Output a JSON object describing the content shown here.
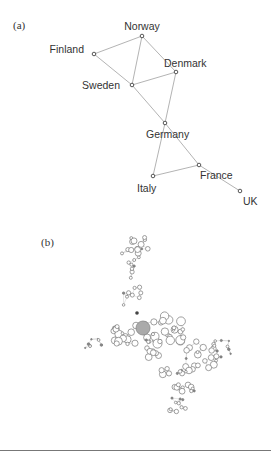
{
  "figure": {
    "panel_a": {
      "label": "(a)",
      "nodes": [
        {
          "id": "Norway",
          "label": "Norway",
          "x": 142,
          "y": 36,
          "lx": 142,
          "ly": 30,
          "anchor": "middle"
        },
        {
          "id": "Finland",
          "label": "Finland",
          "x": 94,
          "y": 54,
          "lx": 84,
          "ly": 53,
          "anchor": "end"
        },
        {
          "id": "Denmark",
          "label": "Denmark",
          "x": 176,
          "y": 72,
          "lx": 164,
          "ly": 67,
          "anchor": "start"
        },
        {
          "id": "Sweden",
          "label": "Sweden",
          "x": 132,
          "y": 85,
          "lx": 120,
          "ly": 89,
          "anchor": "end"
        },
        {
          "id": "Germany",
          "label": "Germany",
          "x": 165,
          "y": 123,
          "lx": 146,
          "ly": 138,
          "anchor": "start"
        },
        {
          "id": "France",
          "label": "France",
          "x": 199,
          "y": 165,
          "lx": 200,
          "ly": 179,
          "anchor": "start"
        },
        {
          "id": "Italy",
          "label": "Italy",
          "x": 153,
          "y": 176,
          "lx": 137,
          "ly": 192,
          "anchor": "start"
        },
        {
          "id": "UK",
          "label": "UK",
          "x": 240,
          "y": 191,
          "lx": 243,
          "ly": 205,
          "anchor": "start"
        }
      ],
      "edges": [
        [
          "Norway",
          "Finland"
        ],
        [
          "Norway",
          "Sweden"
        ],
        [
          "Norway",
          "Denmark"
        ],
        [
          "Finland",
          "Sweden"
        ],
        [
          "Sweden",
          "Denmark"
        ],
        [
          "Sweden",
          "Germany"
        ],
        [
          "Denmark",
          "Germany"
        ],
        [
          "Germany",
          "Italy"
        ],
        [
          "Germany",
          "France"
        ],
        [
          "Italy",
          "France"
        ],
        [
          "France",
          "UK"
        ]
      ]
    },
    "panel_b": {
      "label": "(b)",
      "description": "Large network graph of circular nodes of varying size; one large filled hub node"
    }
  }
}
